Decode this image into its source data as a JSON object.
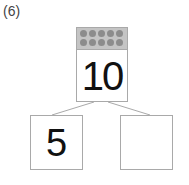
{
  "problem_label": "(6)",
  "whole": {
    "value": "10",
    "dots": 10
  },
  "parts": [
    {
      "value": "5"
    },
    {
      "value": ""
    }
  ],
  "colors": {
    "border": "#a9a9a9",
    "band": "#c4c4c4",
    "dot": "#8c8c8c"
  }
}
